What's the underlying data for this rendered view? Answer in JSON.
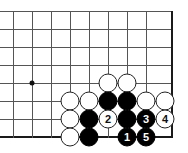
{
  "diagram": {
    "type": "go-board-diagram",
    "board": {
      "columns": 9,
      "rows": 8,
      "origin_x": 13,
      "origin_y": 11,
      "spacing_x": 19,
      "spacing_y": 18,
      "line_color": "#555555",
      "edge_color": "#1a1a1a",
      "background_color": "#ffffff",
      "right_edge_is_border": true,
      "bottom_edge_is_border": true
    },
    "star_points": [
      {
        "col": 1,
        "row": 4
      }
    ],
    "stones": [
      {
        "col": 5,
        "row": 4,
        "color": "white",
        "label": ""
      },
      {
        "col": 6,
        "row": 4,
        "color": "white",
        "label": ""
      },
      {
        "col": 3,
        "row": 5,
        "color": "white",
        "label": ""
      },
      {
        "col": 4,
        "row": 5,
        "color": "white",
        "label": ""
      },
      {
        "col": 5,
        "row": 5,
        "color": "black",
        "label": ""
      },
      {
        "col": 6,
        "row": 5,
        "color": "black",
        "label": ""
      },
      {
        "col": 7,
        "row": 5,
        "color": "white",
        "label": ""
      },
      {
        "col": 8,
        "row": 5,
        "color": "white",
        "label": ""
      },
      {
        "col": 3,
        "row": 6,
        "color": "white",
        "label": ""
      },
      {
        "col": 4,
        "row": 6,
        "color": "black",
        "label": ""
      },
      {
        "col": 5,
        "row": 6,
        "color": "white",
        "label": "2"
      },
      {
        "col": 6,
        "row": 6,
        "color": "black",
        "label": ""
      },
      {
        "col": 7,
        "row": 6,
        "color": "black",
        "label": "3"
      },
      {
        "col": 8,
        "row": 6,
        "color": "white",
        "label": "4"
      },
      {
        "col": 3,
        "row": 7,
        "color": "white",
        "label": ""
      },
      {
        "col": 4,
        "row": 7,
        "color": "black",
        "label": ""
      },
      {
        "col": 6,
        "row": 7,
        "color": "black",
        "label": "1"
      },
      {
        "col": 7,
        "row": 7,
        "color": "black",
        "label": "5"
      }
    ],
    "move_sequence": [
      {
        "number": "1",
        "color": "black"
      },
      {
        "number": "2",
        "color": "white"
      },
      {
        "number": "3",
        "color": "black"
      },
      {
        "number": "4",
        "color": "white"
      },
      {
        "number": "5",
        "color": "black"
      }
    ]
  }
}
